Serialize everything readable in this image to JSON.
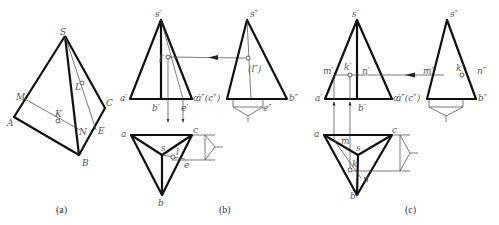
{
  "figure": {
    "panels": [
      {
        "id": "a",
        "caption": "(a)",
        "type": "pictorial",
        "labels": {
          "S": "S",
          "A": "A",
          "B": "B",
          "C": "C",
          "M": "M",
          "N": "N",
          "K": "K",
          "E": "E",
          "L": "L"
        }
      },
      {
        "id": "b",
        "caption": "(b)",
        "type": "three-view projection of point L on face SBC",
        "front_labels": {
          "s": "s′",
          "a": "a′",
          "b": "b′",
          "c": "c′",
          "e": "e′",
          "l": "l′"
        },
        "side_labels": {
          "s": "s″",
          "ac": "a″(c″)",
          "b": "b″",
          "l": "(l″)",
          "e": "e″"
        },
        "top_labels": {
          "a": "a",
          "b": "b",
          "c": "c",
          "s": "s",
          "e": "e",
          "l": "l"
        }
      },
      {
        "id": "c",
        "caption": "(c)",
        "type": "three-view projection of point K on face SAB",
        "front_labels": {
          "s": "s′",
          "a": "a′",
          "b": "b′",
          "c": "c′",
          "m": "m′",
          "k": "k′",
          "n": "n′"
        },
        "side_labels": {
          "s": "s″",
          "ac": "a″(c″)",
          "b": "b″",
          "m": "m″",
          "k": "k″",
          "n": "n″"
        },
        "top_labels": {
          "a": "a",
          "b": "b",
          "c": "c",
          "s": "s",
          "m": "m",
          "k": "k",
          "n": "n"
        }
      }
    ]
  },
  "colors": {
    "line": "#111111",
    "thin": "#444444",
    "label": "#555555",
    "background": "#ffffff"
  }
}
